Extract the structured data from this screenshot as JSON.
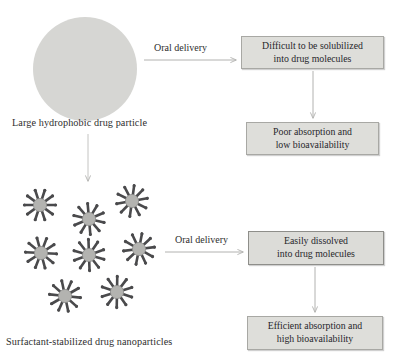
{
  "figure": {
    "colors": {
      "particle_fill": "#d6d6d3",
      "box_fill": "#dededa",
      "box_border": "#a8a8a4",
      "box_border_emphasis": "#8e8e8a",
      "nano_core": "#b3b3b0",
      "nano_spoke": "#4a4a4c",
      "arrow": "#b0b0ae",
      "text": "#2b2b2b"
    }
  },
  "top_row": {
    "particle": {
      "name": "large-hydrophobic-drug-particle",
      "caption": "Large hydrophobic drug particle"
    },
    "arrow_label": "Oral delivery",
    "outcome_box": {
      "line1": "Difficult to be solubilized",
      "line2": "into drug molecules"
    },
    "result_box": {
      "line1": "Poor absorption and",
      "line2": "low bioavailability"
    }
  },
  "bottom_row": {
    "particles": {
      "name": "surfactant-stabilized-drug-nanoparticles",
      "caption": "Surfactant-stabilized drug nanoparticles",
      "count": 8,
      "spokes_per_particle": 10
    },
    "arrow_label": "Oral delivery",
    "outcome_box": {
      "line1": "Easily dissolved",
      "line2": "into drug molecules"
    },
    "result_box": {
      "line1": "Efficient absorption and",
      "line2": "high bioavailability"
    }
  },
  "nano_positions": [
    {
      "x": 20,
      "y": 185
    },
    {
      "x": 69,
      "y": 199
    },
    {
      "x": 112,
      "y": 181
    },
    {
      "x": 21,
      "y": 233
    },
    {
      "x": 69,
      "y": 235
    },
    {
      "x": 119,
      "y": 229
    },
    {
      "x": 45,
      "y": 276
    },
    {
      "x": 97,
      "y": 272
    }
  ]
}
